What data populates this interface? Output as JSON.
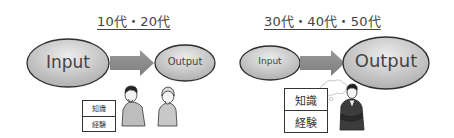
{
  "panels": [
    {
      "title": "10代・20代",
      "input_label": "Input",
      "output_label": "Output",
      "knowledge_box": [
        "知識",
        "経験"
      ],
      "people": [
        "thinking-young-man",
        "thinking-young-woman"
      ]
    },
    {
      "title": "30代・40代・50代",
      "input_label": "Input",
      "output_label": "Output",
      "knowledge_box": [
        "知識",
        "経験"
      ],
      "people": [
        "thinking-businessman"
      ]
    }
  ],
  "colors": {
    "ellipse_fill_light": "#e9e9e9",
    "ellipse_fill_dark": "#b5b5b5",
    "ellipse_stroke": "#2e2e2e",
    "arrow": "#8c8c8c",
    "text": "#444444"
  }
}
